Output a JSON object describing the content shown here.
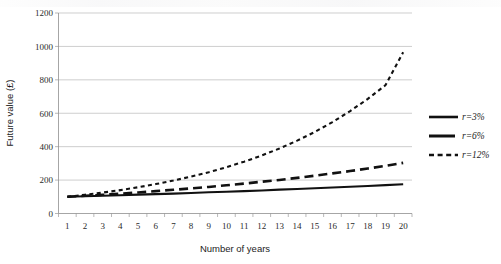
{
  "chart_data": {
    "type": "line",
    "title": "",
    "xlabel": "Number of years",
    "ylabel": "Future value (£)",
    "x": [
      1,
      2,
      3,
      4,
      5,
      6,
      7,
      8,
      9,
      10,
      11,
      12,
      13,
      14,
      15,
      16,
      17,
      18,
      19,
      20
    ],
    "xtick_labels": [
      "1",
      "2",
      "3",
      "4",
      "5",
      "6",
      "7",
      "8",
      "9",
      "10",
      "11",
      "12",
      "13",
      "14",
      "15",
      "16",
      "17",
      "18",
      "19",
      "20"
    ],
    "ytick_labels": [
      "0",
      "200",
      "400",
      "600",
      "800",
      "1000",
      "1200"
    ],
    "yticks": [
      0,
      200,
      400,
      600,
      800,
      1000,
      1200
    ],
    "ylim": [
      0,
      1200
    ],
    "grid": "horizontal",
    "legend_position": "right",
    "series": [
      {
        "name": "r=3%",
        "style": "solid",
        "color": "#111111",
        "values": [
          100,
          103,
          106,
          109,
          113,
          116,
          119,
          123,
          127,
          130,
          134,
          138,
          143,
          147,
          151,
          156,
          160,
          165,
          170,
          175
        ]
      },
      {
        "name": "r=6%",
        "style": "long-dash",
        "color": "#111111",
        "values": [
          100,
          106,
          112,
          119,
          126,
          134,
          142,
          150,
          159,
          169,
          179,
          190,
          201,
          213,
          226,
          240,
          254,
          269,
          285,
          303
        ]
      },
      {
        "name": "r=12%",
        "style": "short-dash",
        "color": "#111111",
        "values": [
          100,
          112,
          125,
          140,
          157,
          176,
          197,
          221,
          247,
          277,
          310,
          347,
          389,
          436,
          488,
          547,
          613,
          686,
          768,
          965
        ]
      }
    ]
  },
  "legend": {
    "items": [
      {
        "label": "r=3%",
        "style": "solid"
      },
      {
        "label": "r=6%",
        "style": "long-dash"
      },
      {
        "label": "r=12%",
        "style": "short-dash"
      }
    ]
  },
  "axes": {
    "x_title": "Number of years",
    "y_title": "Future value (£)"
  }
}
